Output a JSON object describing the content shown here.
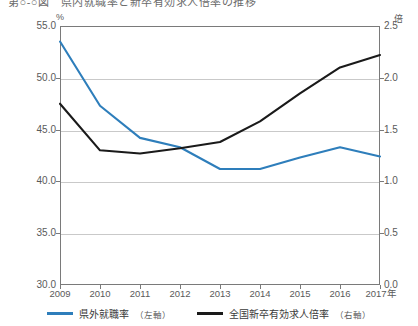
{
  "chart_title": "第○-○図　県内就職率と新卒有効求人倍率の推移",
  "axes": {
    "left_unit": "%",
    "right_unit": "倍",
    "left_ticks": [
      "55.0",
      "50.0",
      "45.0",
      "40.0",
      "35.0",
      "30.0"
    ],
    "right_ticks": [
      "2.5",
      "2.0",
      "1.5",
      "1.0",
      "0.5",
      "0.0"
    ],
    "x_ticks": [
      "2009",
      "2010",
      "2011",
      "2012",
      "2013",
      "2014",
      "2015",
      "2016",
      "2017年"
    ]
  },
  "legend": {
    "items": [
      {
        "label": "県外就職率",
        "axis": "（左軸）",
        "color": "#2e7ebb"
      },
      {
        "label": "全国新卒有効求人倍率",
        "axis": "（右軸）",
        "color": "#1a1a1a"
      }
    ]
  },
  "chart_data": {
    "type": "line",
    "title": "第○-○図　県内就職率と新卒有効求人倍率の推移",
    "xlabel": "年",
    "categories": [
      "2009",
      "2010",
      "2011",
      "2012",
      "2013",
      "2014",
      "2015",
      "2016",
      "2017"
    ],
    "grid": true,
    "legend_position": "bottom",
    "series": [
      {
        "name": "県外就職率（左軸）",
        "axis": "left",
        "unit": "%",
        "color": "#2e7ebb",
        "ylim": [
          30.0,
          55.0
        ],
        "values": [
          53.5,
          47.3,
          44.2,
          43.3,
          41.2,
          41.2,
          42.3,
          43.3,
          42.4
        ]
      },
      {
        "name": "全国新卒有効求人倍率（右軸）",
        "axis": "right",
        "unit": "倍",
        "color": "#1a1a1a",
        "ylim": [
          0.0,
          2.5
        ],
        "values": [
          1.75,
          1.3,
          1.27,
          1.32,
          1.38,
          1.58,
          1.85,
          2.1,
          2.22
        ]
      }
    ]
  }
}
